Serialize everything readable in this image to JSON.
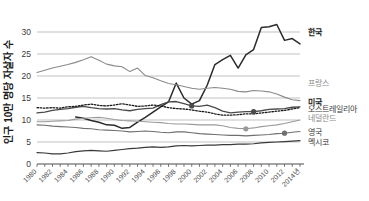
{
  "chart_data": {
    "type": "line",
    "title": "",
    "xlabel": "",
    "ylabel": "인구 10만 명당 자살자 수",
    "ylim": [
      0,
      35
    ],
    "yticks": [
      0,
      5,
      10,
      15,
      20,
      25,
      30
    ],
    "ytick_labels": [
      "0",
      "5",
      "10",
      "15",
      "20",
      "25",
      "30"
    ],
    "grid": true,
    "legend_position": "right",
    "x": [
      1980,
      1981,
      1982,
      1983,
      1984,
      1985,
      1986,
      1987,
      1988,
      1989,
      1990,
      1991,
      1992,
      1993,
      1994,
      1995,
      1996,
      1997,
      1998,
      1999,
      2000,
      2001,
      2002,
      2003,
      2004,
      2005,
      2006,
      2007,
      2008,
      2009,
      2010,
      2011,
      2012,
      2013,
      2014
    ],
    "xtick_labels": [
      "1980",
      "1982",
      "1984",
      "1986",
      "1988",
      "1990",
      "1992",
      "1994",
      "1996",
      "1998",
      "2000",
      "2002",
      "2004",
      "2006",
      "2008",
      "2010",
      "2012",
      "2014년"
    ],
    "xtick_values": [
      1980,
      1982,
      1984,
      1986,
      1988,
      1990,
      1992,
      1994,
      1996,
      1998,
      2000,
      2002,
      2004,
      2006,
      2008,
      2010,
      2012,
      2014
    ],
    "series": [
      {
        "name": "한국",
        "label": "한국",
        "color": "#2b2b2b",
        "width": 1.5,
        "dash": "",
        "bold_label": true,
        "label_y": 30.0,
        "markers": [],
        "values": [
          null,
          null,
          null,
          null,
          null,
          10.7,
          10.4,
          9.9,
          9.5,
          8.9,
          8.8,
          8.1,
          8.3,
          9.5,
          10.6,
          11.8,
          13.0,
          14.1,
          18.4,
          15.0,
          13.6,
          14.4,
          17.9,
          22.6,
          23.7,
          24.7,
          21.8,
          24.8,
          26.0,
          31.0,
          31.2,
          31.7,
          28.1,
          28.5,
          27.3
        ]
      },
      {
        "name": "프랑스",
        "label": "프랑스",
        "color": "#8a8a8a",
        "width": 1.1,
        "dash": "",
        "bold_label": false,
        "label_y": 18.4,
        "markers": [],
        "values": [
          20.8,
          21.3,
          21.8,
          22.2,
          22.6,
          23.1,
          23.7,
          24.4,
          23.6,
          22.7,
          22.3,
          22.1,
          21.0,
          21.8,
          20.1,
          19.6,
          18.9,
          18.3,
          18.0,
          17.6,
          17.2,
          17.0,
          17.2,
          17.4,
          17.2,
          17.0,
          16.5,
          16.4,
          16.7,
          16.6,
          16.4,
          15.9,
          15.2,
          14.6,
          14.4
        ]
      },
      {
        "name": "미국",
        "label": "미국",
        "color": "#4a4a4a",
        "width": 1.3,
        "dash": "",
        "bold_label": true,
        "label_y": 14.0,
        "markers": [
          2000,
          2008
        ],
        "values": [
          11.6,
          11.8,
          12.2,
          12.4,
          12.6,
          12.9,
          13.1,
          12.8,
          12.6,
          12.5,
          12.6,
          12.3,
          12.1,
          12.4,
          12.6,
          12.7,
          13.5,
          14.1,
          14.2,
          13.7,
          13.2,
          13.1,
          13.4,
          12.8,
          12.0,
          11.6,
          11.8,
          11.9,
          11.9,
          12.1,
          12.4,
          12.5,
          12.6,
          12.9,
          13.0
        ]
      },
      {
        "name": "오스트레일리아",
        "label": "오스트레일리아",
        "color": "#1a1a1a",
        "width": 1.3,
        "dash": "1.6 1.6",
        "bold_label": false,
        "label_y": 12.4,
        "markers": [],
        "values": [
          12.8,
          12.7,
          12.8,
          12.7,
          13.0,
          13.1,
          13.4,
          13.6,
          13.3,
          13.2,
          13.4,
          13.7,
          13.4,
          13.1,
          13.2,
          13.4,
          13.2,
          12.8,
          12.6,
          12.5,
          12.3,
          12.0,
          11.8,
          11.4,
          11.1,
          11.1,
          11.2,
          11.4,
          11.4,
          11.6,
          11.8,
          12.0,
          12.2,
          12.5,
          12.8
        ]
      },
      {
        "name": "네덜란드",
        "label": "네덜란드",
        "color": "#9a9a9a",
        "width": 1.1,
        "dash": "",
        "bold_label": false,
        "label_y": 10.5,
        "markers": [
          2007
        ],
        "values": [
          9.6,
          9.6,
          9.7,
          9.8,
          9.9,
          10.2,
          10.4,
          10.5,
          10.6,
          10.4,
          10.1,
          9.9,
          9.8,
          9.7,
          9.6,
          9.5,
          9.4,
          9.2,
          9.1,
          9.1,
          9.0,
          8.9,
          8.9,
          8.9,
          8.7,
          8.3,
          8.1,
          8.0,
          8.2,
          8.5,
          8.7,
          8.9,
          9.2,
          9.6,
          10.0
        ]
      },
      {
        "name": "영국",
        "label": "영국",
        "color": "#6f6f6f",
        "width": 1.1,
        "dash": "",
        "bold_label": false,
        "label_y": 7.3,
        "markers": [
          2012
        ],
        "values": [
          8.9,
          8.8,
          8.6,
          8.5,
          8.4,
          8.3,
          8.1,
          8.0,
          7.8,
          7.7,
          7.6,
          7.5,
          7.3,
          7.4,
          7.5,
          7.4,
          7.2,
          7.1,
          7.3,
          7.3,
          7.1,
          6.9,
          6.8,
          6.7,
          6.6,
          6.5,
          6.5,
          6.4,
          6.5,
          6.6,
          6.7,
          6.9,
          7.0,
          7.2,
          7.4
        ]
      },
      {
        "name": "멕시코",
        "label": "멕시코",
        "color": "#3a3a3a",
        "width": 1.2,
        "dash": "",
        "bold_label": false,
        "label_y": 5.0,
        "markers": [],
        "values": [
          2.6,
          2.5,
          2.3,
          2.3,
          2.5,
          2.8,
          3.0,
          3.1,
          3.0,
          2.9,
          3.1,
          3.3,
          3.5,
          3.6,
          3.8,
          3.9,
          3.8,
          3.9,
          4.1,
          4.2,
          4.1,
          4.2,
          4.3,
          4.3,
          4.4,
          4.4,
          4.5,
          4.5,
          4.6,
          4.8,
          4.9,
          5.0,
          5.1,
          5.2,
          5.3
        ]
      }
    ]
  }
}
